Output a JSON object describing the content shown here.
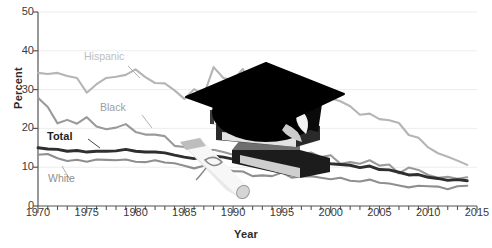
{
  "chart_data": {
    "type": "line",
    "title": "",
    "xlabel": "Year",
    "ylabel": "Percent",
    "xlim": [
      1970,
      2015
    ],
    "ylim": [
      0,
      50
    ],
    "ytick_values": [
      0,
      10,
      20,
      30,
      40,
      50
    ],
    "xtick_values": [
      1970,
      1975,
      1980,
      1985,
      1990,
      1995,
      2000,
      2005,
      2010,
      2015
    ],
    "xtick_labels": [
      "1970",
      "1975",
      "1980",
      "1985",
      "1990",
      "1995",
      "2000",
      "2005",
      "2010",
      "2015"
    ],
    "ytick_labels": [
      "0",
      "10",
      "20",
      "30",
      "40",
      "50"
    ],
    "minor_xtick_step": 1,
    "grid": "horizontal-only",
    "legend": "inline-annotations",
    "x": [
      1970,
      1971,
      1972,
      1973,
      1974,
      1975,
      1976,
      1977,
      1978,
      1979,
      1980,
      1981,
      1982,
      1983,
      1984,
      1985,
      1986,
      1987,
      1988,
      1989,
      1990,
      1991,
      1992,
      1993,
      1994,
      1995,
      1996,
      1997,
      1998,
      1999,
      2000,
      2001,
      2002,
      2003,
      2004,
      2005,
      2006,
      2007,
      2008,
      2009,
      2010,
      2011,
      2012,
      2013,
      2014
    ],
    "series": [
      {
        "name": "Hispanic",
        "color": "#b5b5b5",
        "values": [
          34.3,
          34.0,
          34.3,
          33.5,
          33.0,
          29.2,
          31.4,
          33.0,
          33.3,
          33.8,
          35.2,
          33.2,
          31.7,
          31.6,
          29.8,
          27.6,
          30.1,
          28.6,
          35.8,
          33.0,
          32.4,
          35.3,
          29.4,
          27.5,
          30.0,
          30.0,
          29.4,
          25.3,
          29.5,
          28.6,
          27.8,
          27.0,
          25.7,
          23.5,
          23.8,
          22.4,
          22.1,
          21.4,
          18.3,
          17.6,
          15.1,
          13.6,
          12.7,
          11.7,
          10.6
        ]
      },
      {
        "name": "Black",
        "color": "#9a9a9a",
        "values": [
          27.9,
          25.5,
          21.3,
          22.2,
          21.2,
          22.9,
          20.5,
          19.8,
          20.2,
          21.1,
          19.1,
          18.4,
          18.4,
          18.0,
          15.5,
          15.2,
          14.2,
          14.1,
          14.5,
          13.9,
          13.2,
          13.6,
          13.7,
          13.6,
          12.6,
          12.1,
          13.0,
          13.4,
          13.8,
          12.6,
          13.1,
          10.9,
          11.3,
          10.9,
          11.8,
          10.4,
          10.7,
          8.4,
          9.9,
          9.3,
          8.0,
          7.3,
          7.5,
          7.0,
          7.4
        ]
      },
      {
        "name": "Total",
        "color": "#2f2f2f",
        "values": [
          15.0,
          14.7,
          14.6,
          14.1,
          14.3,
          13.9,
          14.1,
          14.1,
          14.2,
          14.6,
          14.1,
          13.9,
          13.9,
          13.7,
          13.1,
          12.6,
          12.2,
          12.6,
          12.9,
          12.6,
          12.1,
          12.5,
          11.0,
          11.0,
          11.4,
          12.0,
          11.1,
          11.0,
          11.8,
          11.2,
          10.9,
          10.7,
          10.5,
          9.9,
          10.3,
          9.4,
          9.3,
          8.7,
          8.0,
          8.1,
          7.4,
          7.1,
          6.6,
          6.8,
          6.5
        ]
      },
      {
        "name": "White",
        "color": "#8f8f8f",
        "values": [
          13.2,
          13.4,
          12.3,
          11.6,
          11.9,
          11.4,
          12.0,
          11.9,
          11.8,
          12.0,
          11.4,
          11.3,
          11.8,
          11.2,
          11.0,
          10.4,
          9.7,
          10.4,
          9.6,
          9.4,
          9.0,
          8.9,
          7.7,
          7.9,
          7.7,
          8.6,
          7.3,
          7.6,
          7.7,
          7.3,
          6.9,
          7.3,
          6.5,
          6.3,
          6.8,
          6.0,
          5.8,
          5.3,
          4.8,
          5.2,
          5.1,
          5.0,
          4.3,
          5.1,
          5.2
        ]
      }
    ],
    "annotations": [
      {
        "text": "Hispanic",
        "color": "#bdbdbd",
        "bold": false
      },
      {
        "text": "Black",
        "color": "#9e9e9e",
        "bold": false
      },
      {
        "text": "Total",
        "color": "#1f1f1f",
        "bold": true
      },
      {
        "text": "White",
        "color": "#8f8f8f",
        "bold": false
      }
    ],
    "decoration": {
      "name": "graduation-cap-books-diploma-photo",
      "description": "black mortarboard graduation cap resting on a stack of books with a rolled diploma"
    }
  }
}
